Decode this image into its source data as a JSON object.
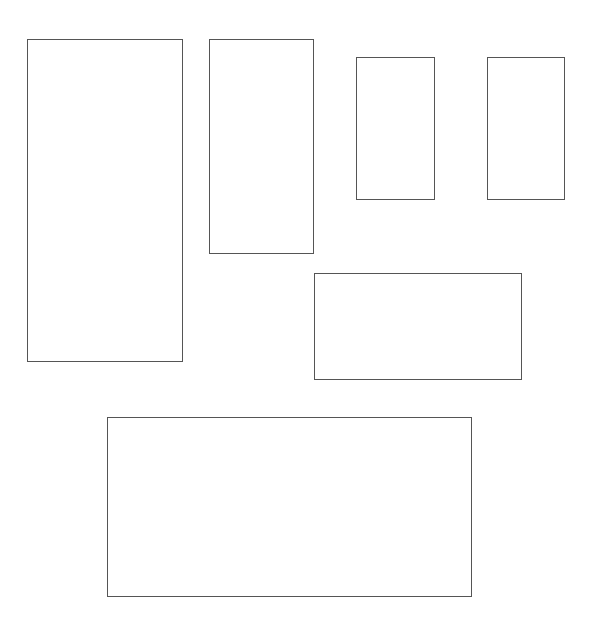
{
  "canvas": {
    "width": 591,
    "height": 624,
    "background": "#ffffff"
  },
  "style": {
    "stroke": "#555555",
    "stroke_width": 1
  },
  "rectangles": [
    {
      "id": "rect-1",
      "x": 27,
      "y": 39,
      "w": 156,
      "h": 323
    },
    {
      "id": "rect-2",
      "x": 209,
      "y": 39,
      "w": 105,
      "h": 215
    },
    {
      "id": "rect-3",
      "x": 356,
      "y": 57,
      "w": 79,
      "h": 143
    },
    {
      "id": "rect-4",
      "x": 487,
      "y": 57,
      "w": 78,
      "h": 143
    },
    {
      "id": "rect-5",
      "x": 314,
      "y": 273,
      "w": 208,
      "h": 107
    },
    {
      "id": "rect-6",
      "x": 107,
      "y": 417,
      "w": 365,
      "h": 180
    }
  ]
}
